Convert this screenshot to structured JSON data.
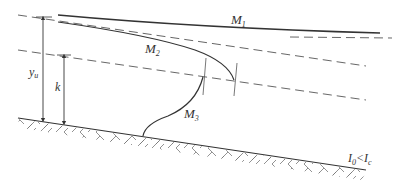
{
  "diagram": {
    "labels": {
      "m1": "M",
      "m1_sub": "1",
      "m2": "M",
      "m2_sub": "2",
      "m3": "M",
      "m3_sub": "3",
      "yu": "y",
      "yu_sub": "u",
      "k": "k",
      "slope_i0": "I",
      "slope_i0_sub": "0",
      "slope_lt": "<",
      "slope_ic": "I",
      "slope_ic_sub": "c"
    },
    "colors": {
      "line": "#333333",
      "dash": "#555555",
      "hatch": "#666666"
    }
  }
}
